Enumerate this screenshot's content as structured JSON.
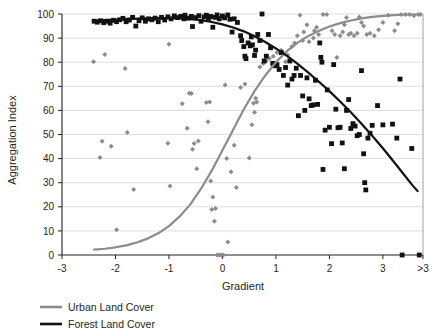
{
  "chart_data": {
    "type": "scatter",
    "title": "",
    "xlabel": "Gradient",
    "ylabel": "Aggregation Index",
    "xlim": [
      -3,
      3.75
    ],
    "ylim": [
      0,
      100
    ],
    "grid": true,
    "grid_axis": "y",
    "legend_position": "bottom-left",
    "xticks": [
      -3,
      -2,
      -1,
      0,
      1,
      2,
      3,
      3.75
    ],
    "xticklabels": [
      "-3",
      "-2",
      "-1",
      "0",
      "1",
      "2",
      "3",
      ">3"
    ],
    "yticks": [
      0,
      10,
      20,
      30,
      40,
      50,
      60,
      70,
      80,
      90,
      100
    ],
    "yticklabels": [
      "0",
      "10",
      "20",
      "30",
      "40",
      "50",
      "60",
      "70",
      "80",
      "90",
      "100"
    ],
    "series": [
      {
        "name": "Urban Land Cover",
        "marker": "diamond",
        "color": "#8c8c8c",
        "trend_color": "#8c8c8c",
        "trend_type": "logistic-increasing",
        "trend_points": [
          [
            -2.4,
            2.2
          ],
          [
            -2.2,
            2.6
          ],
          [
            -2.0,
            3.2
          ],
          [
            -1.8,
            4.0
          ],
          [
            -1.6,
            5.2
          ],
          [
            -1.4,
            6.8
          ],
          [
            -1.2,
            9.0
          ],
          [
            -1.0,
            12.0
          ],
          [
            -0.8,
            16.0
          ],
          [
            -0.6,
            21.0
          ],
          [
            -0.4,
            27.5
          ],
          [
            -0.2,
            35.0
          ],
          [
            0.0,
            43.5
          ],
          [
            0.2,
            52.0
          ],
          [
            0.4,
            60.5
          ],
          [
            0.6,
            68.0
          ],
          [
            0.8,
            74.5
          ],
          [
            1.0,
            80.0
          ],
          [
            1.2,
            84.5
          ],
          [
            1.4,
            88.0
          ],
          [
            1.6,
            90.8
          ],
          [
            1.8,
            93.0
          ],
          [
            2.0,
            94.8
          ],
          [
            2.2,
            96.2
          ],
          [
            2.4,
            97.3
          ],
          [
            2.6,
            98.2
          ],
          [
            2.8,
            98.8
          ],
          [
            3.0,
            99.2
          ],
          [
            3.2,
            99.5
          ],
          [
            3.4,
            99.7
          ],
          [
            3.6,
            99.8
          ],
          [
            3.72,
            99.9
          ]
        ],
        "points": [
          [
            -2.41,
            80.2
          ],
          [
            -2.2,
            83.2
          ],
          [
            -2.25,
            47.2
          ],
          [
            -2.29,
            40.5
          ],
          [
            -2.08,
            45.1
          ],
          [
            -1.98,
            10.5
          ],
          [
            -1.82,
            77.4
          ],
          [
            -1.78,
            50.8
          ],
          [
            -1.66,
            27.2
          ],
          [
            -1.0,
            87.4
          ],
          [
            -1.02,
            46.4
          ],
          [
            -0.98,
            28.6
          ],
          [
            -0.75,
            62.8
          ],
          [
            -0.66,
            52.6
          ],
          [
            -0.62,
            67.1
          ],
          [
            -0.58,
            67.0
          ],
          [
            -0.56,
            43.9
          ],
          [
            -0.53,
            46.3
          ],
          [
            -0.48,
            35.8
          ],
          [
            -0.45,
            47.3
          ],
          [
            -0.3,
            63.3
          ],
          [
            -0.27,
            55.3
          ],
          [
            -0.24,
            63.5
          ],
          [
            -0.22,
            30.7
          ],
          [
            -0.2,
            18.9
          ],
          [
            -0.18,
            24.1
          ],
          [
            -0.15,
            14.0
          ],
          [
            -0.13,
            19.3
          ],
          [
            -0.1,
            0.0
          ],
          [
            -0.06,
            0.0
          ],
          [
            -0.02,
            0.0
          ],
          [
            0.02,
            0.0
          ],
          [
            0.05,
            70.5
          ],
          [
            0.08,
            40.0
          ],
          [
            0.1,
            5.4
          ],
          [
            0.16,
            34.5
          ],
          [
            0.22,
            45.5
          ],
          [
            0.26,
            28.0
          ],
          [
            0.34,
            69.5
          ],
          [
            0.42,
            71.0
          ],
          [
            0.5,
            40.2
          ],
          [
            0.55,
            54.0
          ],
          [
            0.58,
            63.0
          ],
          [
            0.6,
            59.2
          ],
          [
            0.62,
            65.0
          ],
          [
            0.64,
            63.5
          ],
          [
            0.7,
            78.0
          ],
          [
            0.76,
            79.5
          ],
          [
            0.82,
            80.5
          ],
          [
            0.88,
            81.5
          ],
          [
            0.95,
            82.5
          ],
          [
            1.02,
            84.0
          ],
          [
            1.1,
            85.0
          ],
          [
            1.18,
            80.2
          ],
          [
            1.22,
            83.0
          ],
          [
            1.3,
            86.5
          ],
          [
            1.35,
            88.0
          ],
          [
            1.4,
            91.0
          ],
          [
            1.45,
            99.5
          ],
          [
            1.5,
            89.0
          ],
          [
            1.52,
            92.5
          ],
          [
            1.58,
            95.5
          ],
          [
            1.62,
            88.5
          ],
          [
            1.7,
            90.0
          ],
          [
            1.72,
            93.0
          ],
          [
            1.76,
            94.5
          ],
          [
            1.8,
            91.5
          ],
          [
            1.84,
            82.0
          ],
          [
            1.88,
            99.8
          ],
          [
            1.95,
            99.8
          ],
          [
            2.05,
            93.0
          ],
          [
            2.1,
            91.5
          ],
          [
            2.14,
            82.0
          ],
          [
            2.2,
            91.0
          ],
          [
            2.25,
            92.5
          ],
          [
            2.28,
            95.5
          ],
          [
            2.32,
            98.5
          ],
          [
            2.36,
            91.5
          ],
          [
            2.4,
            92.0
          ],
          [
            2.46,
            91.0
          ],
          [
            2.52,
            92.0
          ],
          [
            2.56,
            98.8
          ],
          [
            2.6,
            96.5
          ],
          [
            2.64,
            95.0
          ],
          [
            2.7,
            91.5
          ],
          [
            2.76,
            92.0
          ],
          [
            2.84,
            91.0
          ],
          [
            2.92,
            93.5
          ],
          [
            3.0,
            96.5
          ],
          [
            3.1,
            99.5
          ],
          [
            3.22,
            93.0
          ],
          [
            3.28,
            96.0
          ],
          [
            3.34,
            99.8
          ],
          [
            3.42,
            99.8
          ],
          [
            3.5,
            99.8
          ],
          [
            3.58,
            99.3
          ],
          [
            3.66,
            99.8
          ],
          [
            3.7,
            99.8
          ]
        ]
      },
      {
        "name": "Forest Land Cover",
        "marker": "square",
        "color": "#111111",
        "trend_color": "#111111",
        "trend_type": "logistic-decreasing",
        "trend_points": [
          [
            -2.4,
            97.3
          ],
          [
            -2.2,
            97.5
          ],
          [
            -2.0,
            97.7
          ],
          [
            -1.8,
            97.9
          ],
          [
            -1.6,
            98.1
          ],
          [
            -1.4,
            98.2
          ],
          [
            -1.2,
            98.3
          ],
          [
            -1.0,
            98.3
          ],
          [
            -0.8,
            98.2
          ],
          [
            -0.6,
            97.9
          ],
          [
            -0.4,
            97.4
          ],
          [
            -0.2,
            96.7
          ],
          [
            0.0,
            95.7
          ],
          [
            0.2,
            94.4
          ],
          [
            0.4,
            92.8
          ],
          [
            0.6,
            90.8
          ],
          [
            0.8,
            88.4
          ],
          [
            1.0,
            85.7
          ],
          [
            1.2,
            82.7
          ],
          [
            1.4,
            79.4
          ],
          [
            1.6,
            75.8
          ],
          [
            1.8,
            72.0
          ],
          [
            2.0,
            68.0
          ],
          [
            2.2,
            63.7
          ],
          [
            2.4,
            59.2
          ],
          [
            2.6,
            54.5
          ],
          [
            2.8,
            49.5
          ],
          [
            3.0,
            44.3
          ],
          [
            3.2,
            38.8
          ],
          [
            3.4,
            33.2
          ],
          [
            3.55,
            29.0
          ],
          [
            3.65,
            26.5
          ]
        ],
        "points": [
          [
            -2.4,
            97.0
          ],
          [
            -2.34,
            96.6
          ],
          [
            -2.28,
            97.2
          ],
          [
            -2.22,
            96.4
          ],
          [
            -2.16,
            97.0
          ],
          [
            -2.1,
            96.2
          ],
          [
            -2.04,
            97.4
          ],
          [
            -1.98,
            96.8
          ],
          [
            -1.92,
            97.6
          ],
          [
            -1.86,
            98.2
          ],
          [
            -1.8,
            96.8
          ],
          [
            -1.74,
            97.5
          ],
          [
            -1.68,
            98.6
          ],
          [
            -1.62,
            95.0
          ],
          [
            -1.56,
            97.2
          ],
          [
            -1.5,
            98.4
          ],
          [
            -1.44,
            97.0
          ],
          [
            -1.38,
            98.0
          ],
          [
            -1.32,
            97.6
          ],
          [
            -1.26,
            98.3
          ],
          [
            -1.2,
            96.8
          ],
          [
            -1.14,
            98.6
          ],
          [
            -1.08,
            97.5
          ],
          [
            -1.02,
            98.8
          ],
          [
            -0.96,
            98.0
          ],
          [
            -0.9,
            99.2
          ],
          [
            -0.84,
            98.5
          ],
          [
            -0.78,
            99.0
          ],
          [
            -0.72,
            98.0
          ],
          [
            -0.7,
            99.5
          ],
          [
            -0.64,
            98.3
          ],
          [
            -0.58,
            99.0
          ],
          [
            -0.56,
            94.8
          ],
          [
            -0.5,
            98.5
          ],
          [
            -0.44,
            99.3
          ],
          [
            -0.4,
            97.0
          ],
          [
            -0.34,
            98.8
          ],
          [
            -0.3,
            99.5
          ],
          [
            -0.26,
            98.2
          ],
          [
            -0.22,
            99.0
          ],
          [
            -0.18,
            94.5
          ],
          [
            -0.14,
            98.6
          ],
          [
            -0.1,
            99.6
          ],
          [
            -0.06,
            98.0
          ],
          [
            0.0,
            99.2
          ],
          [
            0.04,
            98.4
          ],
          [
            0.1,
            99.6
          ],
          [
            0.14,
            97.8
          ],
          [
            0.18,
            92.5
          ],
          [
            0.22,
            98.0
          ],
          [
            0.28,
            96.5
          ],
          [
            0.34,
            91.0
          ],
          [
            0.36,
            89.0
          ],
          [
            0.4,
            86.5
          ],
          [
            0.42,
            82.5
          ],
          [
            0.44,
            81.5
          ],
          [
            0.48,
            88.0
          ],
          [
            0.52,
            86.8
          ],
          [
            0.54,
            90.5
          ],
          [
            0.56,
            87.2
          ],
          [
            0.6,
            82.8
          ],
          [
            0.62,
            85.0
          ],
          [
            0.66,
            91.5
          ],
          [
            0.7,
            89.0
          ],
          [
            0.74,
            100.0
          ],
          [
            0.78,
            80.5
          ],
          [
            0.82,
            82.5
          ],
          [
            0.86,
            91.5
          ],
          [
            0.9,
            86.0
          ],
          [
            0.94,
            79.5
          ],
          [
            0.98,
            78.5
          ],
          [
            1.02,
            79.0
          ],
          [
            1.06,
            77.0
          ],
          [
            1.1,
            84.0
          ],
          [
            1.14,
            74.5
          ],
          [
            1.18,
            77.8
          ],
          [
            1.22,
            70.5
          ],
          [
            1.26,
            80.5
          ],
          [
            1.3,
            73.0
          ],
          [
            1.34,
            74.5
          ],
          [
            1.38,
            77.5
          ],
          [
            1.42,
            57.8
          ],
          [
            1.46,
            74.5
          ],
          [
            1.5,
            66.0
          ],
          [
            1.54,
            60.0
          ],
          [
            1.58,
            73.5
          ],
          [
            1.62,
            64.8
          ],
          [
            1.66,
            62.0
          ],
          [
            1.7,
            62.3
          ],
          [
            1.74,
            72.5
          ],
          [
            1.78,
            62.5
          ],
          [
            1.82,
            88.0
          ],
          [
            1.84,
            82.0
          ],
          [
            1.86,
            80.0
          ],
          [
            1.88,
            35.5
          ],
          [
            1.92,
            51.8
          ],
          [
            1.96,
            68.5
          ],
          [
            2.0,
            53.0
          ],
          [
            2.04,
            46.2
          ],
          [
            2.08,
            79.0
          ],
          [
            2.12,
            60.5
          ],
          [
            2.16,
            52.8
          ],
          [
            2.2,
            53.0
          ],
          [
            2.24,
            46.5
          ],
          [
            2.28,
            35.8
          ],
          [
            2.32,
            60.0
          ],
          [
            2.36,
            64.5
          ],
          [
            2.4,
            52.5
          ],
          [
            2.44,
            54.5
          ],
          [
            2.48,
            53.5
          ],
          [
            2.52,
            49.5
          ],
          [
            2.56,
            50.0
          ],
          [
            2.6,
            76.5
          ],
          [
            2.64,
            42.0
          ],
          [
            2.66,
            30.0
          ],
          [
            2.68,
            27.0
          ],
          [
            2.72,
            48.5
          ],
          [
            2.76,
            50.5
          ],
          [
            2.8,
            53.8
          ],
          [
            2.9,
            62.0
          ],
          [
            3.0,
            54.0
          ],
          [
            3.18,
            54.3
          ],
          [
            3.26,
            48.5
          ],
          [
            3.32,
            73.0
          ],
          [
            3.36,
            0.0
          ],
          [
            3.54,
            44.2
          ],
          [
            3.68,
            0.0
          ]
        ]
      }
    ],
    "legend": [
      {
        "label": "Urban Land Cover",
        "color": "#8c8c8c"
      },
      {
        "label": "Forest Land Cover",
        "color": "#111111"
      }
    ]
  }
}
